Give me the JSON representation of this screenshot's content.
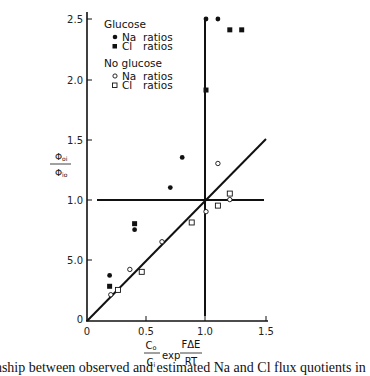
{
  "chart_data": {
    "type": "scatter",
    "title": "",
    "xlabel": "(Co/Ci) exp(FΔE/RT)",
    "ylabel": "Φoi / Φio",
    "xlim": [
      0,
      1.5
    ],
    "ylim": [
      0,
      2.5
    ],
    "x_ticks": [
      "0",
      "0.5",
      "1.0",
      "1.5"
    ],
    "y_ticks": [
      "0",
      "5.0",
      "1.0",
      "1.5",
      "2.0",
      "2.5"
    ],
    "grid": false,
    "legend_position": "upper-left inside",
    "legend_groups": [
      {
        "title": "Glucose",
        "entries": [
          {
            "marker": "filled-circle",
            "label": "Na  ratios"
          },
          {
            "marker": "filled-square",
            "label": "Cl  ratios"
          }
        ]
      },
      {
        "title": "No glucose",
        "entries": [
          {
            "marker": "open-circle",
            "label": "Na  ratios"
          },
          {
            "marker": "open-square",
            "label": "Cl  ratios"
          }
        ]
      }
    ],
    "series": [
      {
        "name": "Glucose Na ratios",
        "marker": "filled-circle",
        "points": [
          [
            0.19,
            0.37
          ],
          [
            0.4,
            0.75
          ],
          [
            0.7,
            1.1
          ],
          [
            0.8,
            1.35
          ],
          [
            1.0,
            2.5
          ],
          [
            1.1,
            2.5
          ]
        ]
      },
      {
        "name": "Glucose Cl ratios",
        "marker": "filled-square",
        "points": [
          [
            0.19,
            0.28
          ],
          [
            0.4,
            0.8
          ],
          [
            1.0,
            1.91
          ],
          [
            1.2,
            2.41
          ],
          [
            1.3,
            2.41
          ]
        ]
      },
      {
        "name": "No glucose Na ratios",
        "marker": "open-circle",
        "points": [
          [
            0.2,
            0.21
          ],
          [
            0.36,
            0.42
          ],
          [
            0.63,
            0.65
          ],
          [
            1.0,
            0.9
          ],
          [
            1.1,
            1.3
          ],
          [
            1.2,
            1.0
          ]
        ]
      },
      {
        "name": "No glucose Cl ratios",
        "marker": "open-square",
        "points": [
          [
            0.26,
            0.25
          ],
          [
            0.46,
            0.4
          ],
          [
            0.88,
            0.81
          ],
          [
            1.1,
            0.95
          ],
          [
            1.2,
            1.05
          ]
        ]
      }
    ],
    "reference_lines": [
      {
        "name": "identity line",
        "from": [
          0,
          0
        ],
        "to": [
          1.5,
          1.5
        ]
      },
      {
        "name": "horizontal at 1.0",
        "from": [
          0.1,
          1.0
        ],
        "to": [
          1.5,
          1.0
        ]
      },
      {
        "name": "vertical at 1.0",
        "from": [
          1.0,
          0.03
        ],
        "to": [
          1.0,
          2.5
        ]
      }
    ]
  },
  "axes": {
    "y_ticks": [
      {
        "label": "2.5",
        "y": 19
      },
      {
        "label": "2.0",
        "y": 80
      },
      {
        "label": "1.5",
        "y": 140
      },
      {
        "label": "1.0",
        "y": 200
      },
      {
        "label": "5.0",
        "y": 260
      },
      {
        "label": "0",
        "y": 320
      }
    ],
    "x_ticks": [
      {
        "label": "0",
        "x": 87
      },
      {
        "label": "0.5",
        "x": 146
      },
      {
        "label": "1.0",
        "x": 205
      },
      {
        "label": "1.5",
        "x": 266
      }
    ],
    "ylabel_num": "Φ",
    "ylabel_num_sub": "oi",
    "ylabel_den": "Φ",
    "ylabel_den_sub": "io",
    "xlabel_num": "C",
    "xlabel_num_sub": "o",
    "xlabel_den": "C",
    "xlabel_den_sub": "i",
    "xlabel_exp": "exp",
    "xlabel_frac_num": "FΔE",
    "xlabel_frac_den": "RT"
  },
  "legend": {
    "group1_title": "Glucose",
    "group1_item1_name": "Na",
    "group1_item1_suffix": "ratios",
    "group1_item2_name": "Cl",
    "group1_item2_suffix": "ratios",
    "group2_title": "No glucose",
    "group2_item1_name": "Na",
    "group2_item1_suffix": "ratios",
    "group2_item2_name": "Cl",
    "group2_item2_suffix": "ratios"
  },
  "caption": "lationship between observed and estimated Na and Cl flux quotients in"
}
